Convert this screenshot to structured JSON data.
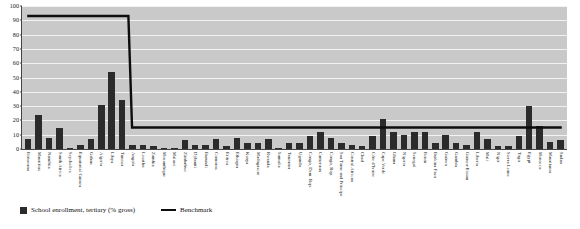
{
  "chart_data": {
    "type": "bar",
    "title": "",
    "xlabel": "",
    "ylabel": "",
    "ylim": [
      0,
      100
    ],
    "yticks": [
      0,
      10,
      20,
      30,
      40,
      50,
      60,
      70,
      80,
      90,
      100
    ],
    "grid": true,
    "legend_position": "bottom-left",
    "categories": [
      "Botswana",
      "Mauritius",
      "Namibia",
      "South Africa",
      "Seychelles",
      "Equatorial Guinea",
      "Gabon",
      "Algeria",
      "Libya",
      "Tunisia",
      "Angola",
      "Lesotho",
      "Zambia",
      "Mozambique",
      "Malawi",
      "Zimbabwe",
      "Djibouti",
      "Burundi",
      "Comoros",
      "Eritrea",
      "Ethiopia",
      "Kenya",
      "Madagascar",
      "Rwanda",
      "Somalia",
      "Tanzania",
      "Uganda",
      "Congo, Dem. Rep.",
      "Cameroon",
      "Congo, Rep.",
      "Sao Tome and Principe",
      "Central African",
      "Chad",
      "Côte d'Ivoire",
      "Cape Verde",
      "Ghana",
      "Nigeria",
      "Senegal",
      "Benin",
      "Burkina Faso",
      "Guinea",
      "Gambia",
      "Guinea-Bissau",
      "Liberia",
      "Mali",
      "Niger",
      "Sierra Leone",
      "Togo",
      "Egypt",
      "Morocco",
      "Mauritania",
      "Sudan"
    ],
    "series": [
      {
        "name": "School enrollment, tertiary (% gross)",
        "color": "#2b2b2b",
        "type": "bar",
        "values": [
          7,
          24,
          8,
          15,
          0,
          3,
          7,
          31,
          54,
          34,
          3,
          3,
          2,
          1,
          0.5,
          6,
          3,
          3,
          7,
          2,
          8,
          4,
          4,
          7,
          0.5,
          4,
          4,
          9,
          12,
          8,
          4,
          3,
          2,
          9,
          21,
          12,
          10,
          12,
          12,
          4,
          10,
          4,
          3,
          12,
          7,
          2,
          2,
          9,
          30,
          16,
          5,
          6
        ]
      },
      {
        "name": "Benchmark",
        "color": "#0d0d0d",
        "type": "line",
        "values": [
          93,
          93,
          93,
          93,
          93,
          93,
          93,
          93,
          93,
          93,
          15,
          15,
          15,
          15,
          15,
          15,
          15,
          15,
          15,
          15,
          15,
          15,
          15,
          15,
          15,
          15,
          15,
          15,
          15,
          15,
          15,
          15,
          15,
          15,
          15,
          15,
          15,
          15,
          15,
          15,
          15,
          15,
          15,
          15,
          15,
          15,
          15,
          15,
          15,
          15,
          15,
          15
        ]
      }
    ],
    "legend": [
      {
        "label": "School enrollment, tertiary (% gross)",
        "marker": "square",
        "color": "#2b2b2b"
      },
      {
        "label": "Benchmark",
        "marker": "line",
        "color": "#0d0d0d"
      }
    ]
  },
  "colors": {
    "plot_background": "#c9c9c9",
    "gridline": "#f2f2f2",
    "bar": "#2b2b2b",
    "benchmark_line": "#0d0d0d",
    "page_background": "#ffffff",
    "text": "#111111"
  }
}
